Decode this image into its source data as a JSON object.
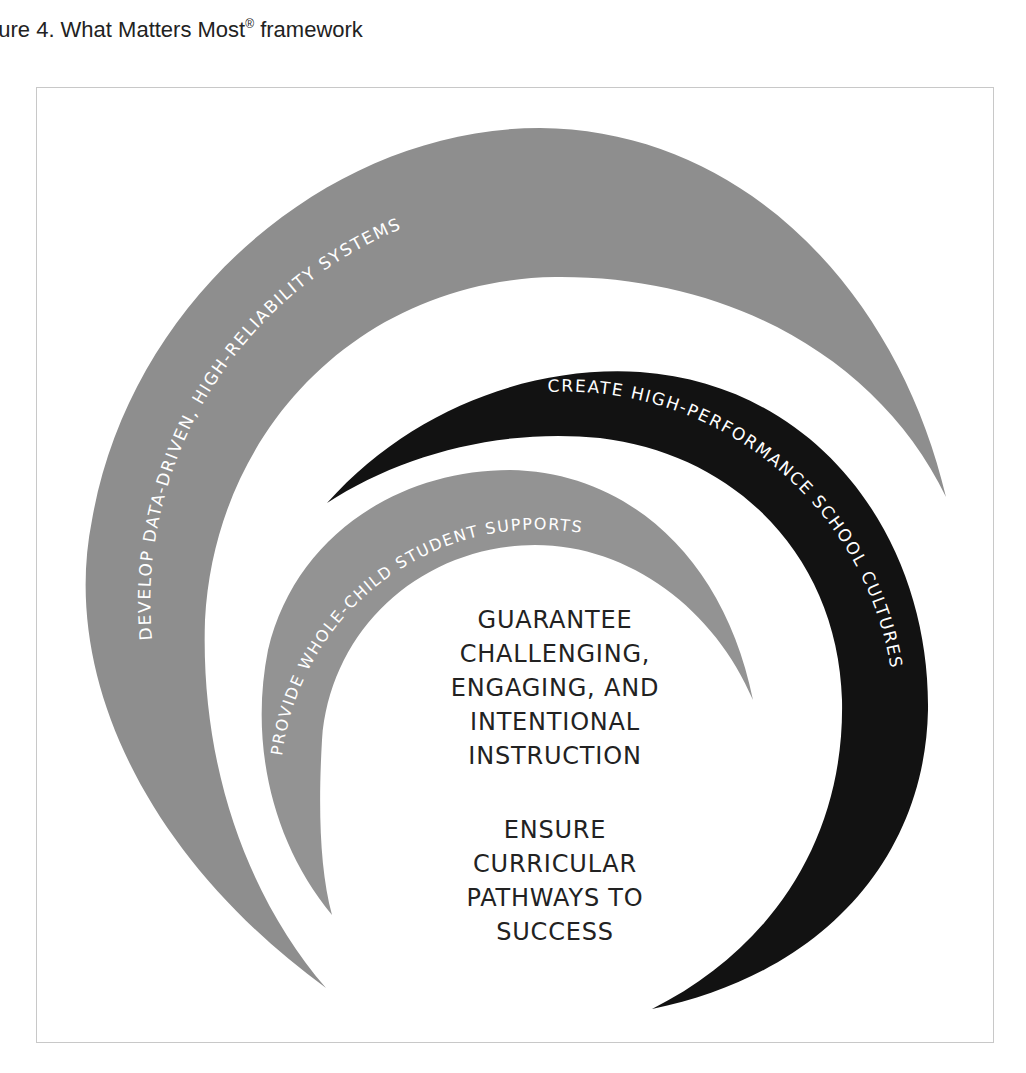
{
  "caption": {
    "prefix": "gure 4. What Matters Most",
    "registered_mark": "®",
    "suffix": " framework"
  },
  "colors": {
    "outer_ring": "#8e8e8e",
    "middle_ring": "#121212",
    "inner_ring": "#939393",
    "ring_text": "#ffffff",
    "center_text": "#222222",
    "frame_border": "#c8c8c8"
  },
  "rings": {
    "outer": {
      "label": "DEVELOP DATA-DRIVEN, HIGH-RELIABILITY SYSTEMS"
    },
    "middle": {
      "label": "CREATE HIGH-PERFORMANCE SCHOOL CULTURES"
    },
    "inner": {
      "label": "PROVIDE WHOLE-CHILD STUDENT SUPPORTS"
    }
  },
  "center": {
    "block1": [
      "GUARANTEE",
      "CHALLENGING,",
      "ENGAGING, AND",
      "INTENTIONAL",
      "INSTRUCTION"
    ],
    "block2": [
      "ENSURE",
      "CURRICULAR",
      "PATHWAYS TO",
      "SUCCESS"
    ]
  }
}
